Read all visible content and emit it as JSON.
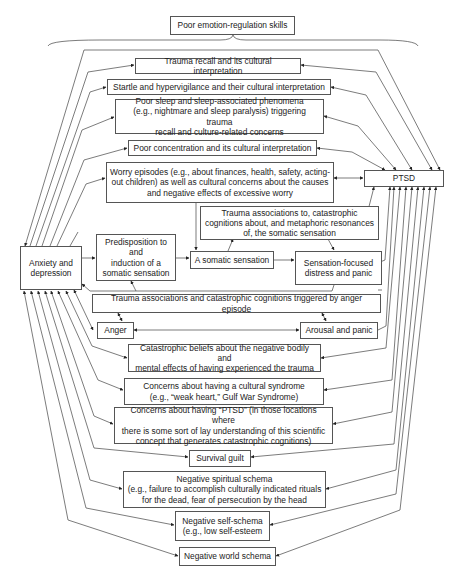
{
  "diagram": {
    "type": "flow-diagram",
    "top_label": "Poor emotion-regulation skills",
    "nodes": {
      "emotion_regulation": "Poor emotion-regulation skills",
      "trauma_recall": "Trauma recall and its cultural interpretation",
      "startle": "Startle and hypervigilance and their cultural interpretation",
      "poor_sleep": "Poor sleep and sleep-associated phenomena\n(e.g., nightmare and sleep paralysis) triggering trauma\nrecall and culture-related concerns",
      "poor_concentration": "Poor concentration and its cultural interpretation",
      "worry": "Worry episodes (e.g., about finances, health, safety, acting-\nout children) as well as cultural concerns about the causes\nand negative effects of excessive worry",
      "ptsd": "PTSD",
      "trauma_assoc_somatic": "Trauma associations to, catastrophic\ncognitions about, and metaphoric resonances\nof, the somatic sensation",
      "anxiety": "Anxiety and\ndepression",
      "predisposition": "Predisposition to\nand\ninduction of a\nsomatic sensation",
      "somatic": "A somatic sensation",
      "sensation_focused": "Sensation-focused\ndistress and panic",
      "trauma_assoc_anger": "Trauma associations and catastrophic cognitions triggered by anger episode",
      "anger": "Anger",
      "arousal": "Arousal and panic",
      "catastrophic_beliefs": "Catastrophic beliefs about the negative bodily and\nmental effects of having experienced the trauma",
      "cultural_syndrome": "Concerns about having a cultural syndrome\n(e.g., “weak heart,” Gulf War Syndrome)",
      "concerns_ptsd": "Concerns about having “PTSD” (in those locations where\nthere is some sort of lay understanding of this scientific\nconcept that generates catastrophic cognitions)",
      "survival_guilt": "Survival guilt",
      "neg_spiritual": "Negative spiritual schema\n(e.g., failure to accomplish culturally indicated rituals\nfor the dead, fear of persecution by the head",
      "neg_self": "Negative self-schema\n(e.g., low self-esteem",
      "neg_world": "Negative world schema"
    }
  }
}
